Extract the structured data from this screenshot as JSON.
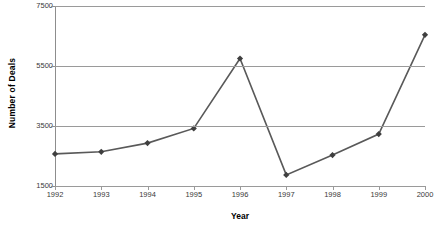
{
  "chart_data": {
    "type": "line",
    "title": "",
    "xlabel": "Year",
    "ylabel": "Number of Deals",
    "categories": [
      "1992",
      "1993",
      "1994",
      "1995",
      "1996",
      "1997",
      "1998",
      "1999",
      "2000"
    ],
    "x": [
      1992,
      1993,
      1994,
      1995,
      1996,
      1997,
      1998,
      1999,
      2000
    ],
    "values": [
      2570,
      2640,
      2930,
      3420,
      5750,
      1870,
      2530,
      3230,
      6540
    ],
    "series": [
      {
        "name": "Number of Deals",
        "values": [
          2570,
          2640,
          2930,
          3420,
          5750,
          1870,
          2530,
          3230,
          6540
        ]
      }
    ],
    "ylim": [
      1500,
      7500
    ],
    "yticks": [
      1500,
      3500,
      5500,
      7500
    ],
    "ytick_labels": [
      "1500",
      "3500",
      "5500",
      "7500"
    ],
    "grid": "horizontal",
    "legend": "none",
    "line_color": "#595959",
    "marker_color": "#3f3f3f",
    "marker": "diamond",
    "gridline_color": "#9a9a9a",
    "background_color": "#ffffff"
  }
}
